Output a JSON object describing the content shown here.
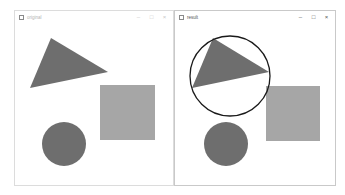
{
  "windows": [
    {
      "title": "original",
      "active": false,
      "controls": {
        "minimize": "–",
        "maximize": "□",
        "close": "×"
      },
      "shapes": {
        "triangle": {
          "points": "51,38 108,72 30,88",
          "fill": "#6e6e6e"
        },
        "square": {
          "x": 100,
          "y": 85,
          "w": 55,
          "h": 55,
          "fill": "#a6a6a6"
        },
        "circle": {
          "cx": 64,
          "cy": 144,
          "r": 22,
          "fill": "#6e6e6e"
        }
      }
    },
    {
      "title": "result",
      "active": true,
      "controls": {
        "minimize": "–",
        "maximize": "□",
        "close": "×"
      },
      "shapes": {
        "triangle": {
          "points": "213,38 269,72 192,88",
          "fill": "#6e6e6e"
        },
        "enclosing_circle": {
          "cx": 230,
          "cy": 76,
          "r": 40,
          "stroke": "#1a1a1a"
        },
        "square": {
          "x": 266,
          "y": 86,
          "w": 54,
          "h": 55,
          "fill": "#a6a6a6"
        },
        "circle": {
          "cx": 226,
          "cy": 144,
          "r": 22,
          "fill": "#6e6e6e"
        }
      }
    }
  ]
}
